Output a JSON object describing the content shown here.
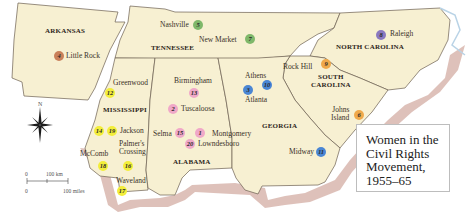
{
  "title": {
    "lines": [
      "Women in the",
      "Civil Rights",
      "Movement,",
      "1955–65"
    ]
  },
  "states": {
    "arkansas": "ARKANSAS",
    "tennessee": "TENNESSEE",
    "north_carolina": "NORTH CAROLINA",
    "south_carolina_1": "SOUTH",
    "south_carolina_2": "CAROLINA",
    "mississippi": "MISSISSIPPI",
    "alabama": "ALABAMA",
    "georgia": "GEORGIA"
  },
  "cities": {
    "little_rock": "Little Rock",
    "nashville": "Nashville",
    "new_market": "New Market",
    "raleigh": "Raleigh",
    "greenwood": "Greenwood",
    "birmingham": "Birmingham",
    "tuscaloosa": "Tuscaloosa",
    "athens": "Athens",
    "atlanta": "Atlanta",
    "rock_hill": "Rock Hill",
    "johns_island_1": "Johns",
    "johns_island_2": "Island",
    "jackson": "Jackson",
    "palmers_crossing_1": "Palmer's",
    "palmers_crossing_2": "Crossing",
    "mccomb": "McComb",
    "selma": "Selma",
    "montgomery": "Montgomery",
    "lowndesboro": "Lowndesboro",
    "midway": "Midway",
    "waveland": "Waveland"
  },
  "markers": [
    {
      "id": "little_rock",
      "num": "4",
      "color": "#c9805a"
    },
    {
      "id": "nashville",
      "num": "5",
      "color": "#7fb86a"
    },
    {
      "id": "new_market",
      "num": "7",
      "color": "#7fb86a"
    },
    {
      "id": "raleigh",
      "num": "8",
      "color": "#8a78c0"
    },
    {
      "id": "greenwood",
      "num": "12",
      "color": "#f3ee3a"
    },
    {
      "id": "birmingham",
      "num": "13",
      "color": "#f0a8c8"
    },
    {
      "id": "tuscaloosa",
      "num": "2",
      "color": "#f0a8c8"
    },
    {
      "id": "atlanta",
      "num": "3",
      "color": "#4a86d4"
    },
    {
      "id": "athens",
      "num": "10",
      "color": "#4a86d4"
    },
    {
      "id": "rock_hill",
      "num": "9",
      "color": "#f0a94a"
    },
    {
      "id": "johns_island",
      "num": "6",
      "color": "#f0a94a"
    },
    {
      "id": "jackson_a",
      "num": "14",
      "color": "#f3ee3a"
    },
    {
      "id": "jackson_b",
      "num": "19",
      "color": "#f3ee3a"
    },
    {
      "id": "mccomb",
      "num": "18",
      "color": "#f3ee3a"
    },
    {
      "id": "palmers_crossing",
      "num": "16",
      "color": "#f3ee3a"
    },
    {
      "id": "selma",
      "num": "15",
      "color": "#f0a8c8"
    },
    {
      "id": "montgomery",
      "num": "1",
      "color": "#f0a8c8"
    },
    {
      "id": "lowndesboro",
      "num": "20",
      "color": "#f0a8c8"
    },
    {
      "id": "midway",
      "num": "11",
      "color": "#4a86d4"
    },
    {
      "id": "waveland",
      "num": "17",
      "color": "#f3ee3a"
    }
  ],
  "compass": {
    "north_label": "N"
  },
  "scale": {
    "km_zero": "0",
    "km_label": "100 km",
    "mi_zero": "0",
    "mi_label": "100 miles"
  },
  "colors": {
    "land": "#f7f0d2",
    "coast": "#d9b7b0",
    "border": "#6b5f50",
    "water_edge": "#b9d3e6"
  }
}
